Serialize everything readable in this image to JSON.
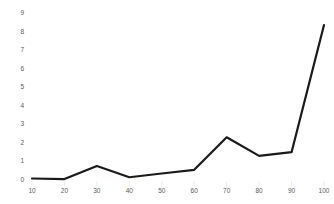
{
  "chart_data": {
    "type": "line",
    "title": "",
    "subtitle": "",
    "xlabel": "",
    "ylabel": "",
    "x": [
      10,
      20,
      30,
      40,
      50,
      60,
      70,
      80,
      90,
      100
    ],
    "values": [
      0.08,
      0.05,
      0.75,
      0.15,
      0.35,
      0.55,
      2.3,
      1.3,
      1.5,
      8.35
    ],
    "series": [
      {
        "name": "series-1",
        "values": [
          0.08,
          0.05,
          0.75,
          0.15,
          0.35,
          0.55,
          2.3,
          1.3,
          1.5,
          8.35
        ]
      }
    ],
    "x_tick_labels": [
      "10",
      "20",
      "30",
      "40",
      "50",
      "60",
      "70",
      "80",
      "90",
      "100"
    ],
    "y_tick_labels": [
      "0",
      "1",
      "2",
      "3",
      "4",
      "5",
      "6",
      "7",
      "8",
      "9"
    ],
    "y_ticks": [
      0,
      1,
      2,
      3,
      4,
      5,
      6,
      7,
      8,
      9
    ],
    "xlim": [
      10,
      100
    ],
    "ylim": [
      0,
      9
    ],
    "grid": false,
    "legend": false,
    "legend_position": "none",
    "line_color": "#1a1a1a",
    "line_width": 2.2,
    "tick_label_color": "#5a5a5a",
    "background_color": "#ffffff"
  }
}
